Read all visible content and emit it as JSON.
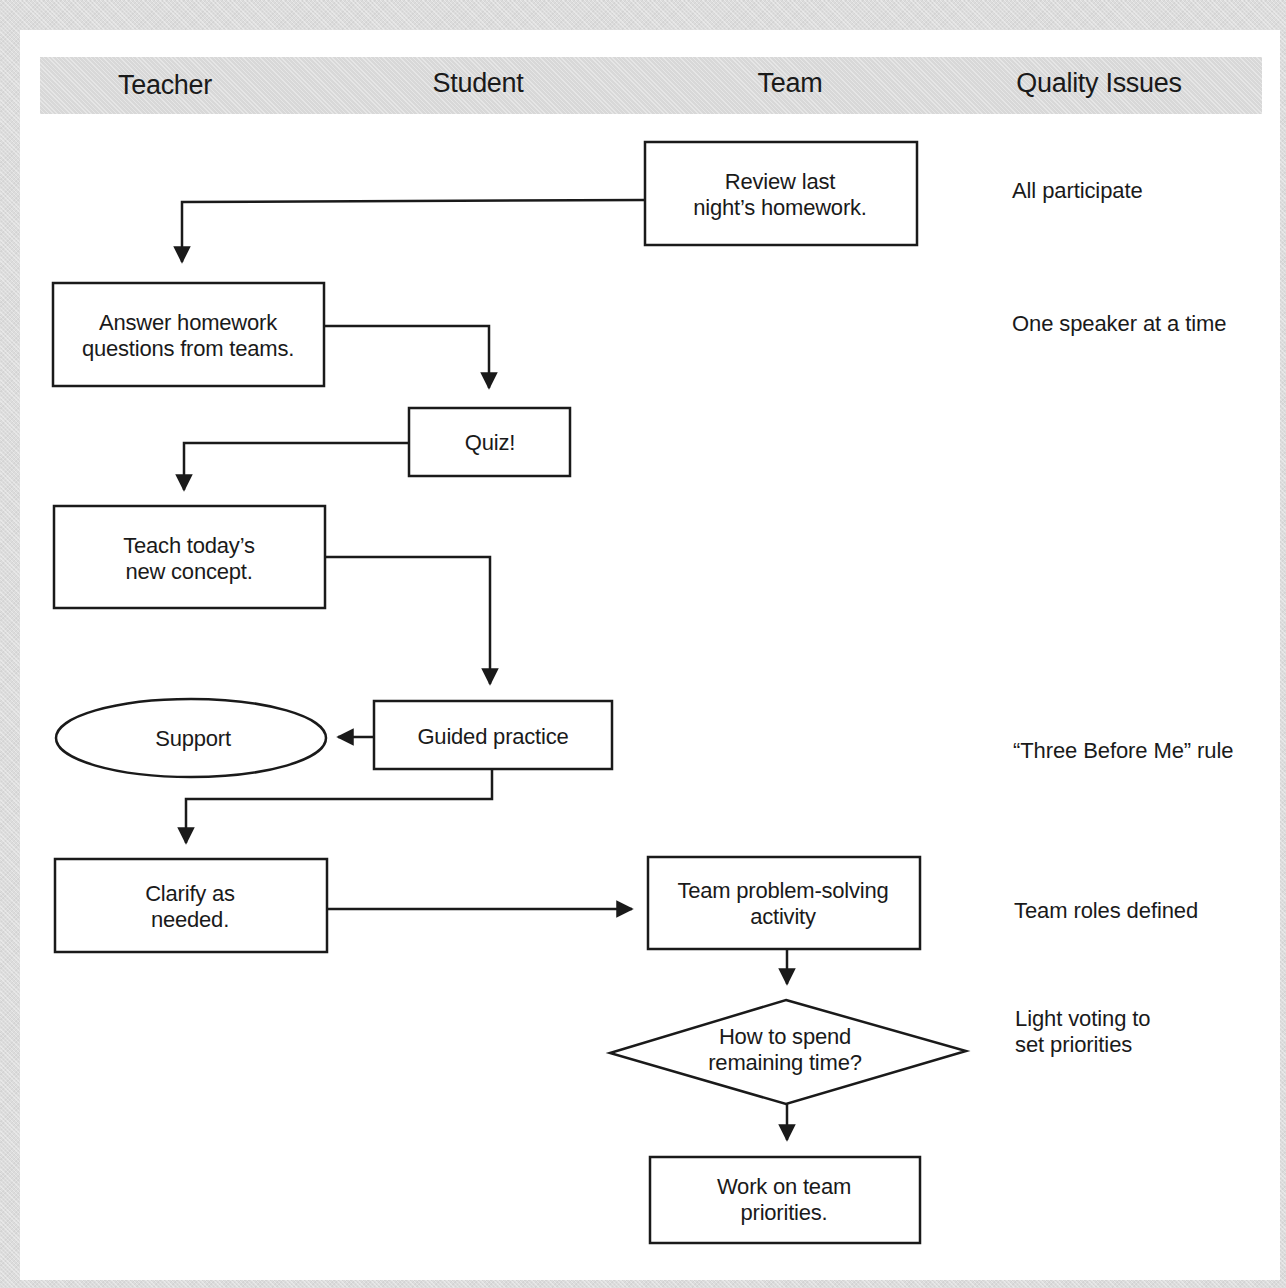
{
  "columns": [
    "Teacher",
    "Student",
    "Team",
    "Quality Issues"
  ],
  "nodes": {
    "review": [
      "Review last",
      "night’s homework."
    ],
    "answer": [
      "Answer homework",
      "questions from teams."
    ],
    "quiz": [
      "Quiz!"
    ],
    "teach": [
      "Teach today’s",
      "new concept."
    ],
    "support": [
      "Support"
    ],
    "guided": [
      "Guided practice"
    ],
    "clarify": [
      "Clarify as",
      "needed."
    ],
    "team_activity": [
      "Team problem-solving",
      "activity"
    ],
    "decision": [
      "How to spend",
      "remaining time?"
    ],
    "work": [
      "Work on team",
      "priorities."
    ]
  },
  "quality_issues": {
    "all_participate": [
      "All participate"
    ],
    "one_speaker": [
      "One speaker at a time"
    ],
    "three_before_me": [
      "“Three Before Me” rule"
    ],
    "team_roles": [
      "Team roles defined"
    ],
    "light_voting": [
      "Light voting to",
      "set priorities"
    ]
  },
  "edges": [
    {
      "from": "review",
      "to": "answer"
    },
    {
      "from": "answer",
      "to": "quiz"
    },
    {
      "from": "quiz",
      "to": "teach"
    },
    {
      "from": "teach",
      "to": "guided"
    },
    {
      "from": "guided",
      "to": "support"
    },
    {
      "from": "guided",
      "to": "clarify"
    },
    {
      "from": "clarify",
      "to": "team_activity"
    },
    {
      "from": "team_activity",
      "to": "decision"
    },
    {
      "from": "decision",
      "to": "work"
    }
  ],
  "colors": {
    "stroke": "#1a1a1a",
    "header_band": "#d8d8d8",
    "background": "#dcdcdc"
  }
}
